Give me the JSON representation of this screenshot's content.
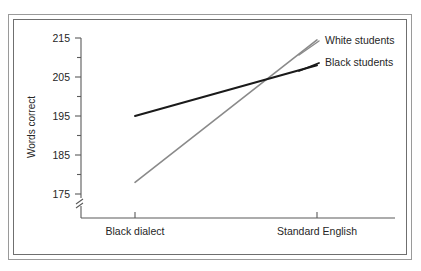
{
  "chart_data": {
    "type": "line",
    "title": "",
    "subtitle": "",
    "xlabel": "",
    "ylabel": "Words correct",
    "categories": [
      "Black dialect",
      "Standard English"
    ],
    "x": [
      0,
      1
    ],
    "series": [
      {
        "name": "White students",
        "values": [
          178,
          214.5
        ],
        "color": "#8a8a8a"
      },
      {
        "name": "Black students",
        "values": [
          195,
          208
        ],
        "color": "#1a1a1a"
      }
    ],
    "ylim": [
      170,
      215
    ],
    "y_axis_break": true,
    "y_major_ticks": [
      175,
      185,
      195,
      205,
      215
    ],
    "y_minor_ticks": [
      180,
      190,
      200,
      210
    ],
    "y_tick_labels": [
      "175",
      "185",
      "195",
      "205",
      "215"
    ],
    "grid": false,
    "legend_position": "right-inline",
    "legend_entries": [
      "White students",
      "Black students"
    ]
  },
  "axes": {
    "y_title": "Words correct",
    "y_labels": {
      "t215": "215",
      "t205": "205",
      "t195": "195",
      "t185": "185",
      "t175": "175"
    },
    "x_labels": {
      "cat1": "Black dialect",
      "cat2": "Standard English"
    }
  },
  "legend": {
    "white": "White students",
    "black": "Black students"
  },
  "colors": {
    "white_students_line": "#8a8a8a",
    "black_students_line": "#1a1a1a",
    "axis": "#5a5a5a",
    "frame_outer": "#9a9a9a",
    "frame_inner": "#6f6f6f",
    "background": "#ffffff",
    "text": "#262626"
  }
}
